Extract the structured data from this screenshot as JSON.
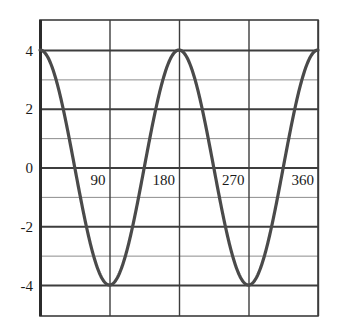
{
  "chart_data": {
    "type": "line",
    "title": "",
    "subtitle": "",
    "xlabel": "",
    "ylabel": "",
    "function": "y = 4 cos(2x)",
    "xlim": [
      0,
      360
    ],
    "ylim": [
      -4.8,
      5.0
    ],
    "x_ticks": [
      90,
      180,
      270,
      360
    ],
    "x_tick_labels": [
      "90",
      "180",
      "270",
      "360"
    ],
    "y_ticks": [
      4,
      2,
      0,
      -2,
      -4
    ],
    "y_tick_labels": [
      "4",
      "2",
      "0",
      "-2",
      "-4"
    ],
    "y_minor_gridlines": [
      3,
      1,
      -1,
      -3
    ],
    "grid": true,
    "legend": "none",
    "series": [
      {
        "name": "y = 4 cos(2x)",
        "color": "#4a4a4a",
        "x": [
          0,
          10,
          20,
          30,
          40,
          45,
          50,
          60,
          70,
          80,
          90,
          100,
          110,
          120,
          130,
          135,
          140,
          150,
          160,
          170,
          180,
          190,
          200,
          210,
          220,
          225,
          230,
          240,
          250,
          260,
          270,
          280,
          290,
          300,
          310,
          315,
          320,
          330,
          340,
          350,
          360
        ],
        "y": [
          4,
          3.76,
          3.06,
          2,
          0.69,
          0,
          -0.69,
          -2,
          -3.06,
          -3.76,
          -4,
          -3.76,
          -3.06,
          -2,
          -0.69,
          0,
          0.69,
          2,
          3.06,
          3.76,
          4,
          3.76,
          3.06,
          2,
          0.69,
          0,
          -0.69,
          -2,
          -3.06,
          -3.76,
          -4,
          -3.76,
          -3.06,
          -2,
          -0.69,
          0,
          0.69,
          2,
          3.06,
          3.76,
          4
        ]
      }
    ],
    "maxima": [
      {
        "x": 0,
        "y": 4
      },
      {
        "x": 180,
        "y": 4
      },
      {
        "x": 360,
        "y": 4
      }
    ],
    "minima": [
      {
        "x": 90,
        "y": -4
      },
      {
        "x": 270,
        "y": -4
      }
    ],
    "amplitude": 4,
    "period": 180,
    "colors": {
      "curve": "#4a4a4a",
      "major_gridline": "#3d3d3d",
      "minor_gridline": "#8c8c8c",
      "frame": "#3d3d3d",
      "axis": "#2b2b2b",
      "background": "#ffffff",
      "tick_label": "#1a1a1a"
    }
  }
}
